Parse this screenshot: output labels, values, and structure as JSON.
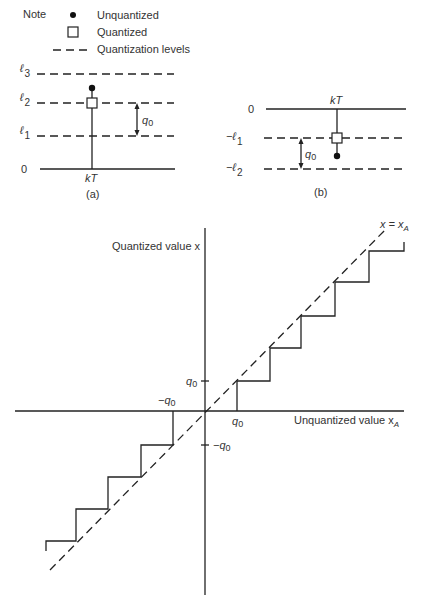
{
  "legend": {
    "title": "Note",
    "items": [
      {
        "icon": "filled-dot-icon",
        "label": "Unquantized"
      },
      {
        "icon": "open-square-icon",
        "label": "Quantized"
      },
      {
        "icon": "dashed-line-icon",
        "label": "Quantization levels"
      }
    ]
  },
  "figure_a": {
    "caption": "(a)",
    "zero_label": "0",
    "levels": [
      {
        "sym": "ℓ",
        "sub": "3"
      },
      {
        "sym": "ℓ",
        "sub": "2"
      },
      {
        "sym": "ℓ",
        "sub": "1"
      }
    ],
    "time_label": "kT",
    "step_label": "q",
    "step_sub": "0"
  },
  "figure_b": {
    "caption": "(b)",
    "zero_label": "0",
    "levels": [
      {
        "sym": "−ℓ",
        "sub": "1"
      },
      {
        "sym": "−ℓ",
        "sub": "2"
      }
    ],
    "time_label": "kT",
    "step_label": "q",
    "step_sub": "0"
  },
  "main_plot": {
    "y_axis_label": "Quantized value x",
    "x_axis_label": "Unquantized value x",
    "x_axis_sub": "A",
    "diagonal_label": "x = x",
    "diagonal_sub": "A",
    "tick_q0_pos": "q",
    "tick_q0_neg": "−q",
    "tick_sub": "0"
  }
}
